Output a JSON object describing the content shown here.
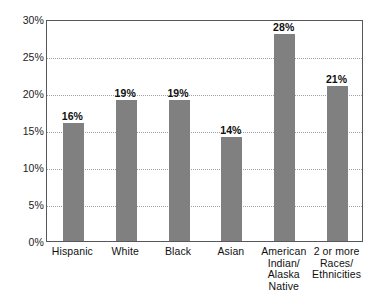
{
  "artifact": {
    "clipped_top_text": " "
  },
  "chart_data": {
    "type": "bar",
    "title": "",
    "subtitle": "",
    "xlabel": "",
    "ylabel": "",
    "ylim": [
      0,
      30
    ],
    "y_tick_step": 5,
    "y_ticks": [
      "0%",
      "5%",
      "10%",
      "15%",
      "20%",
      "25%",
      "30%"
    ],
    "y_tick_values": [
      0,
      5,
      10,
      15,
      20,
      25,
      30
    ],
    "grid": "horizontal-dotted",
    "legend": "none",
    "value_labels": true,
    "bar_color": "#808080",
    "plot_border_color": "#58585c",
    "gridline_color": "#9aa3ad",
    "categories": [
      "Hispanic",
      "White",
      "Black",
      "Asian",
      "American\nIndian/\nAlaska\nNative",
      "2 or more\nRaces/\nEthnicities"
    ],
    "values": [
      16,
      19,
      19,
      14,
      28,
      21
    ],
    "labels": [
      "16%",
      "19%",
      "19%",
      "14%",
      "28%",
      "21%"
    ]
  }
}
